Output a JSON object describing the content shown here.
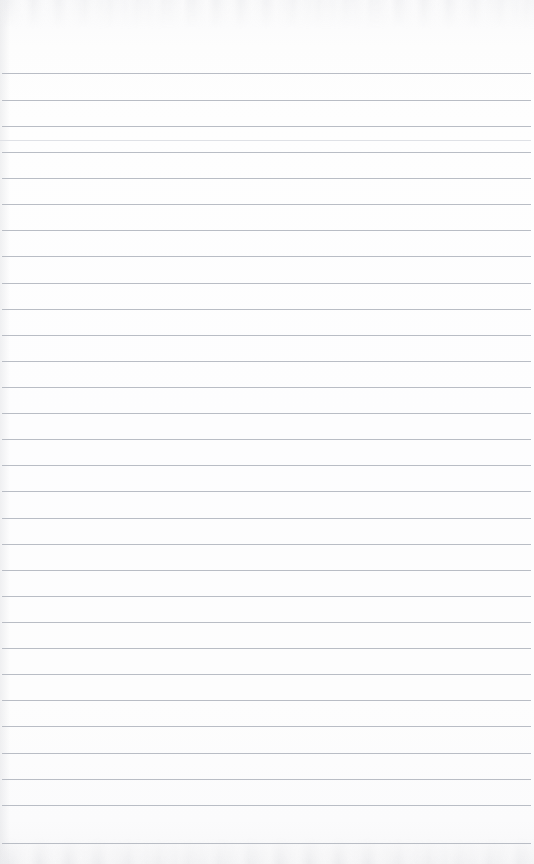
{
  "page": {
    "kind": "lined-notebook-page",
    "width": 534,
    "height": 864,
    "content_text": "",
    "is_blank": true,
    "handwriting": []
  },
  "paper": {
    "background_color": "#fdfdfd",
    "edge_tint_color": "#f7f7f8",
    "scan_noise_color": "#c6c8ce"
  },
  "ruling": {
    "line_color": "#b9bdc5",
    "faint_line_color": "#dfe1e6",
    "line_thickness": 1,
    "line_spacing": 26.2,
    "first_line_y": 73,
    "line_count": 30,
    "left_inset": 2,
    "right_inset": 5,
    "has_margin_rule": false,
    "lines": [
      {
        "y": 73,
        "x1": 2,
        "x2": 531,
        "faint": false
      },
      {
        "y": 100,
        "x1": 2,
        "x2": 531,
        "faint": false
      },
      {
        "y": 126,
        "x1": 2,
        "x2": 531,
        "faint": false
      },
      {
        "y": 140,
        "x1": 0,
        "x2": 531,
        "faint": true
      },
      {
        "y": 152,
        "x1": 2,
        "x2": 531,
        "faint": false
      },
      {
        "y": 178,
        "x1": 2,
        "x2": 531,
        "faint": false
      },
      {
        "y": 204,
        "x1": 2,
        "x2": 531,
        "faint": false
      },
      {
        "y": 230,
        "x1": 2,
        "x2": 531,
        "faint": false
      },
      {
        "y": 256,
        "x1": 2,
        "x2": 531,
        "faint": false
      },
      {
        "y": 283,
        "x1": 2,
        "x2": 531,
        "faint": false
      },
      {
        "y": 309,
        "x1": 2,
        "x2": 531,
        "faint": false
      },
      {
        "y": 335,
        "x1": 2,
        "x2": 531,
        "faint": false
      },
      {
        "y": 361,
        "x1": 2,
        "x2": 531,
        "faint": false
      },
      {
        "y": 387,
        "x1": 2,
        "x2": 531,
        "faint": false
      },
      {
        "y": 413,
        "x1": 2,
        "x2": 531,
        "faint": false
      },
      {
        "y": 439,
        "x1": 2,
        "x2": 531,
        "faint": false
      },
      {
        "y": 465,
        "x1": 2,
        "x2": 531,
        "faint": false
      },
      {
        "y": 491,
        "x1": 2,
        "x2": 531,
        "faint": false
      },
      {
        "y": 518,
        "x1": 2,
        "x2": 531,
        "faint": false
      },
      {
        "y": 544,
        "x1": 2,
        "x2": 531,
        "faint": false
      },
      {
        "y": 570,
        "x1": 2,
        "x2": 531,
        "faint": false
      },
      {
        "y": 596,
        "x1": 2,
        "x2": 531,
        "faint": false
      },
      {
        "y": 622,
        "x1": 2,
        "x2": 531,
        "faint": false
      },
      {
        "y": 648,
        "x1": 2,
        "x2": 531,
        "faint": false
      },
      {
        "y": 674,
        "x1": 2,
        "x2": 531,
        "faint": false
      },
      {
        "y": 700,
        "x1": 2,
        "x2": 531,
        "faint": false
      },
      {
        "y": 726,
        "x1": 2,
        "x2": 531,
        "faint": false
      },
      {
        "y": 753,
        "x1": 2,
        "x2": 531,
        "faint": false
      },
      {
        "y": 779,
        "x1": 2,
        "x2": 531,
        "faint": false
      },
      {
        "y": 805,
        "x1": 2,
        "x2": 531,
        "faint": false
      },
      {
        "y": 843,
        "x1": 2,
        "x2": 531,
        "faint": false
      }
    ]
  }
}
